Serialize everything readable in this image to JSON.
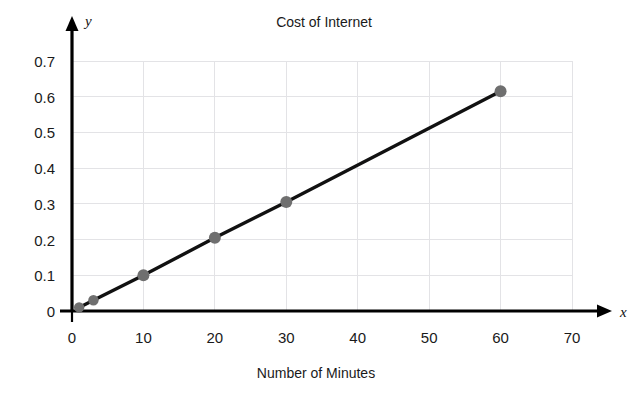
{
  "chart_data": {
    "type": "line",
    "title": "Cost of Internet",
    "xlabel": "Number of Minutes",
    "ylabel": "",
    "x_axis_variable": "x",
    "y_axis_variable": "y",
    "xlim": [
      0,
      70
    ],
    "ylim": [
      0,
      0.7
    ],
    "grid": true,
    "legend": "none",
    "x_ticks": [
      "0",
      "10",
      "20",
      "30",
      "40",
      "50",
      "60",
      "70"
    ],
    "x_tick_values": [
      0,
      10,
      20,
      30,
      40,
      50,
      60,
      70
    ],
    "y_ticks": [
      "0",
      "0.1",
      "0.2",
      "0.3",
      "0.4",
      "0.5",
      "0.6",
      "0.7"
    ],
    "y_tick_values": [
      0,
      0.1,
      0.2,
      0.3,
      0.4,
      0.5,
      0.6,
      0.7
    ],
    "series": [
      {
        "name": "Cost of Internet",
        "line_color": "#111111",
        "marker_color": "#6f6f6f",
        "x": [
          1,
          3,
          10,
          20,
          30,
          60
        ],
        "y": [
          0.01,
          0.03,
          0.1,
          0.205,
          0.305,
          0.615
        ],
        "points": [
          {
            "x": 1,
            "y": 0.01
          },
          {
            "x": 3,
            "y": 0.03
          },
          {
            "x": 10,
            "y": 0.1
          },
          {
            "x": 20,
            "y": 0.205
          },
          {
            "x": 30,
            "y": 0.305
          },
          {
            "x": 60,
            "y": 0.615
          }
        ]
      }
    ]
  },
  "colors": {
    "line": "#111111",
    "marker": "#6f6f6f",
    "grid": "#e3e3e6",
    "axis": "#000000",
    "text": "#1a1a1a",
    "background": "#ffffff"
  }
}
